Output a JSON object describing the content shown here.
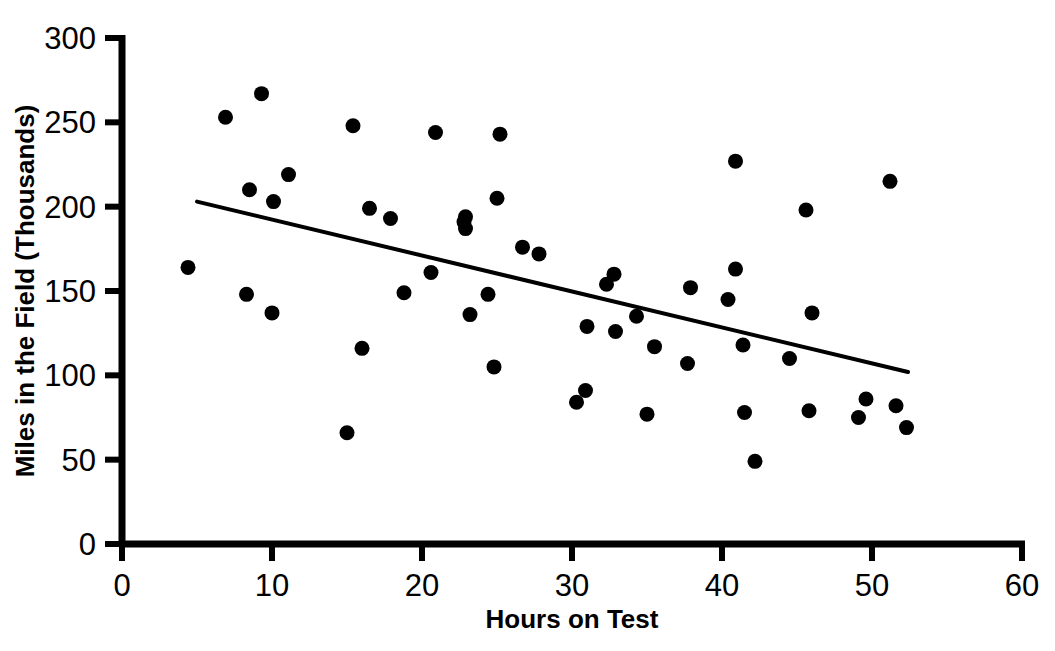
{
  "chart_data": {
    "type": "scatter",
    "title": "",
    "xlabel": "Hours on Test",
    "ylabel": "Miles in the Field (Thousands)",
    "xlim": [
      0,
      60
    ],
    "ylim": [
      0,
      300
    ],
    "xticks": [
      0,
      10,
      20,
      30,
      40,
      50,
      60
    ],
    "yticks": [
      0,
      50,
      100,
      150,
      200,
      250,
      300
    ],
    "xtick_labels": [
      "0",
      "10",
      "20",
      "30",
      "40",
      "50",
      "60"
    ],
    "ytick_labels": [
      "0",
      "50",
      "100",
      "150",
      "200",
      "250",
      "300"
    ],
    "grid": false,
    "legend": null,
    "marker": "filled-circle",
    "marker_color": "#000000",
    "point_count": 52,
    "points": [
      {
        "x": 4.4,
        "y": 164
      },
      {
        "x": 6.9,
        "y": 253
      },
      {
        "x": 8.3,
        "y": 148
      },
      {
        "x": 8.5,
        "y": 210
      },
      {
        "x": 9.3,
        "y": 267
      },
      {
        "x": 10.0,
        "y": 137
      },
      {
        "x": 10.1,
        "y": 203
      },
      {
        "x": 11.1,
        "y": 219
      },
      {
        "x": 15.0,
        "y": 66
      },
      {
        "x": 15.4,
        "y": 248
      },
      {
        "x": 16.0,
        "y": 116
      },
      {
        "x": 16.5,
        "y": 199
      },
      {
        "x": 17.9,
        "y": 193
      },
      {
        "x": 18.8,
        "y": 149
      },
      {
        "x": 20.6,
        "y": 161
      },
      {
        "x": 20.9,
        "y": 244
      },
      {
        "x": 22.8,
        "y": 191
      },
      {
        "x": 22.9,
        "y": 187
      },
      {
        "x": 23.2,
        "y": 136
      },
      {
        "x": 24.4,
        "y": 148
      },
      {
        "x": 25.0,
        "y": 205
      },
      {
        "x": 25.2,
        "y": 243
      },
      {
        "x": 24.8,
        "y": 105
      },
      {
        "x": 26.7,
        "y": 176
      },
      {
        "x": 27.8,
        "y": 172
      },
      {
        "x": 30.3,
        "y": 84
      },
      {
        "x": 30.9,
        "y": 91
      },
      {
        "x": 31.0,
        "y": 129
      },
      {
        "x": 32.3,
        "y": 154
      },
      {
        "x": 32.8,
        "y": 160
      },
      {
        "x": 32.9,
        "y": 126
      },
      {
        "x": 34.3,
        "y": 135
      },
      {
        "x": 35.0,
        "y": 77
      },
      {
        "x": 35.5,
        "y": 117
      },
      {
        "x": 37.7,
        "y": 107
      },
      {
        "x": 37.9,
        "y": 152
      },
      {
        "x": 40.4,
        "y": 145
      },
      {
        "x": 40.9,
        "y": 163
      },
      {
        "x": 40.9,
        "y": 227
      },
      {
        "x": 41.4,
        "y": 118
      },
      {
        "x": 41.5,
        "y": 78
      },
      {
        "x": 42.2,
        "y": 49
      },
      {
        "x": 44.5,
        "y": 110
      },
      {
        "x": 45.6,
        "y": 198
      },
      {
        "x": 45.8,
        "y": 79
      },
      {
        "x": 46.0,
        "y": 137
      },
      {
        "x": 49.1,
        "y": 75
      },
      {
        "x": 49.6,
        "y": 86
      },
      {
        "x": 51.2,
        "y": 215
      },
      {
        "x": 51.6,
        "y": 82
      },
      {
        "x": 52.3,
        "y": 69
      },
      {
        "x": 22.9,
        "y": 194
      }
    ],
    "trend_line": {
      "type": "linear-fit",
      "x_start": 5.0,
      "y_start": 203,
      "x_end": 52.4,
      "y_end": 102,
      "color": "#000000"
    }
  }
}
